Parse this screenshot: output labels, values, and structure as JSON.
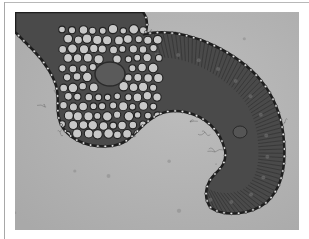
{
  "image": {
    "subject": "micrograph of plant tissue cross-section",
    "description": "Grayscale light micrograph of a curved leaf/stem cross-section showing large parenchyma cells around a central vascular bundle, radially elongated palisade-like cells along the curved arm, and a beaded epidermal border on a light gray background",
    "colors": {
      "background": "#b4b4b4",
      "tissue_dark": "#3a3a3a",
      "tissue_mid": "#6e6e6e",
      "cell_light": "#c8c8c8",
      "epidermis_bead": "#e6e6e6",
      "frame_line": "#a8a8a8"
    }
  }
}
